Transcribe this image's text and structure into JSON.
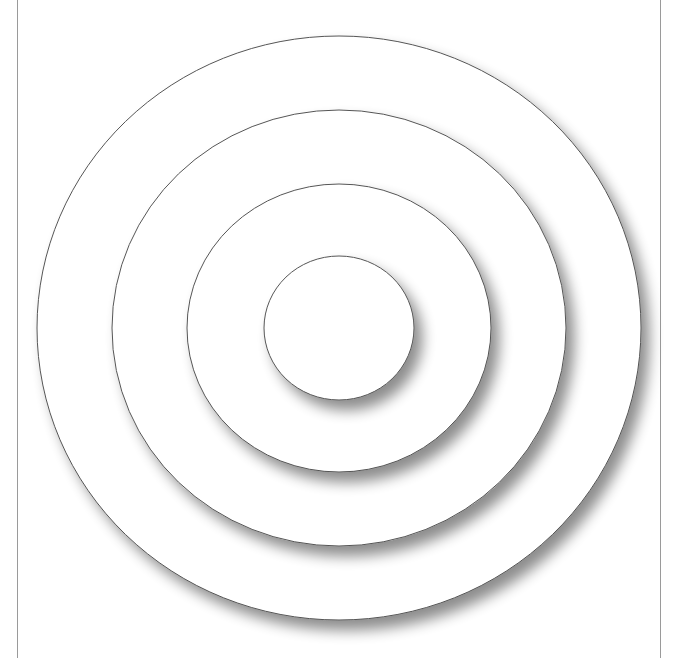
{
  "diagram": {
    "type": "concentric-circles",
    "background": "#ffffff",
    "stroke_color": "#555555",
    "frame_color": "#9a9a9a",
    "center": {
      "cx": 339,
      "cy": 328
    },
    "rings": [
      {
        "name": "ring-1-outer",
        "rx": 302,
        "ry": 292
      },
      {
        "name": "ring-2",
        "rx": 227,
        "ry": 218
      },
      {
        "name": "ring-3",
        "rx": 152,
        "ry": 144
      },
      {
        "name": "ring-4-inner",
        "rx": 75,
        "ry": 72
      }
    ],
    "shadow": {
      "dx": 8,
      "dy": 10,
      "blur": 7,
      "opacity": 0.45
    }
  }
}
